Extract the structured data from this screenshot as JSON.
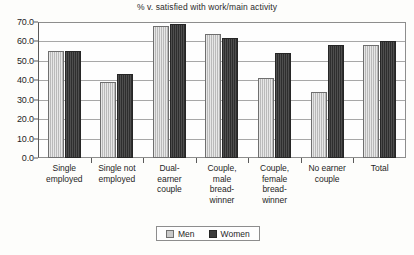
{
  "chart_data": {
    "type": "bar",
    "title": "% v. satisfied with work/main activity",
    "xlabel": "",
    "ylabel": "",
    "ylim": [
      0.0,
      70.0
    ],
    "ytick_labels": [
      "0.0",
      "10.0",
      "20.0",
      "30.0",
      "40.0",
      "50.0",
      "60.0",
      "70.0"
    ],
    "ytick_values": [
      0.0,
      10.0,
      20.0,
      30.0,
      40.0,
      50.0,
      60.0,
      70.0
    ],
    "grid": true,
    "legend_position": "bottom",
    "categories": [
      "Single employed",
      "Single not employed",
      "Dual-earner couple",
      "Couple, male bread-winner",
      "Couple, female bread-winner",
      "No earner couple",
      "Total"
    ],
    "category_lines": [
      [
        "Single",
        "employed"
      ],
      [
        "Single not",
        "employed"
      ],
      [
        "Dual-",
        "earner",
        "couple"
      ],
      [
        "Couple,",
        "male",
        "bread-",
        "winner"
      ],
      [
        "Couple,",
        "female",
        "bread-",
        "winner"
      ],
      [
        "No earner",
        "couple"
      ],
      [
        "Total"
      ]
    ],
    "series": [
      {
        "name": "Men",
        "color": "#c9c9c9",
        "values": [
          55.0,
          39.0,
          68.0,
          64.0,
          41.0,
          34.0,
          58.0
        ]
      },
      {
        "name": "Women",
        "color": "#3b3b3b",
        "values": [
          55.0,
          43.0,
          69.0,
          62.0,
          54.0,
          58.0,
          60.0
        ]
      }
    ]
  }
}
